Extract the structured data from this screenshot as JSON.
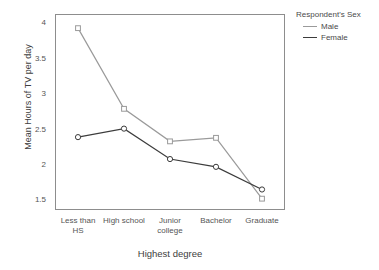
{
  "chart_data": {
    "type": "line",
    "title": "",
    "xlabel": "Highest degree",
    "ylabel": "Mean Hours of TV per day",
    "categories": [
      "Less than HS",
      "High school",
      "Junior college",
      "Bachelor",
      "Graduate"
    ],
    "category_lines": [
      [
        "Less than",
        "HS"
      ],
      [
        "High school"
      ],
      [
        "Junior",
        "college"
      ],
      [
        "Bachelor"
      ],
      [
        "Graduate"
      ]
    ],
    "series": [
      {
        "name": "Male",
        "color": "#9a9a9a",
        "marker": "square",
        "values": [
          3.92,
          2.78,
          2.32,
          2.37,
          1.51
        ]
      },
      {
        "name": "Female",
        "color": "#3c3c3c",
        "marker": "circle",
        "values": [
          2.38,
          2.5,
          2.07,
          1.96,
          1.64
        ]
      }
    ],
    "ylim": [
      1.35,
      4.12
    ],
    "yticks": [
      1.5,
      2,
      2.5,
      3,
      3.5,
      4
    ],
    "ytick_labels": [
      "1.5",
      "2",
      "2.5",
      "3",
      "3.5",
      "4"
    ],
    "grid": false,
    "legend_position": "right"
  },
  "legend": {
    "title": "Respondent's Sex",
    "entries": [
      {
        "label": "Male",
        "color": "#9a9a9a"
      },
      {
        "label": "Female",
        "color": "#3c3c3c"
      }
    ]
  },
  "colors": {
    "frame": "#8d8d8d",
    "text": "#4a4a4a",
    "male": "#9a9a9a",
    "female": "#3c3c3c",
    "background": "#ffffff"
  }
}
